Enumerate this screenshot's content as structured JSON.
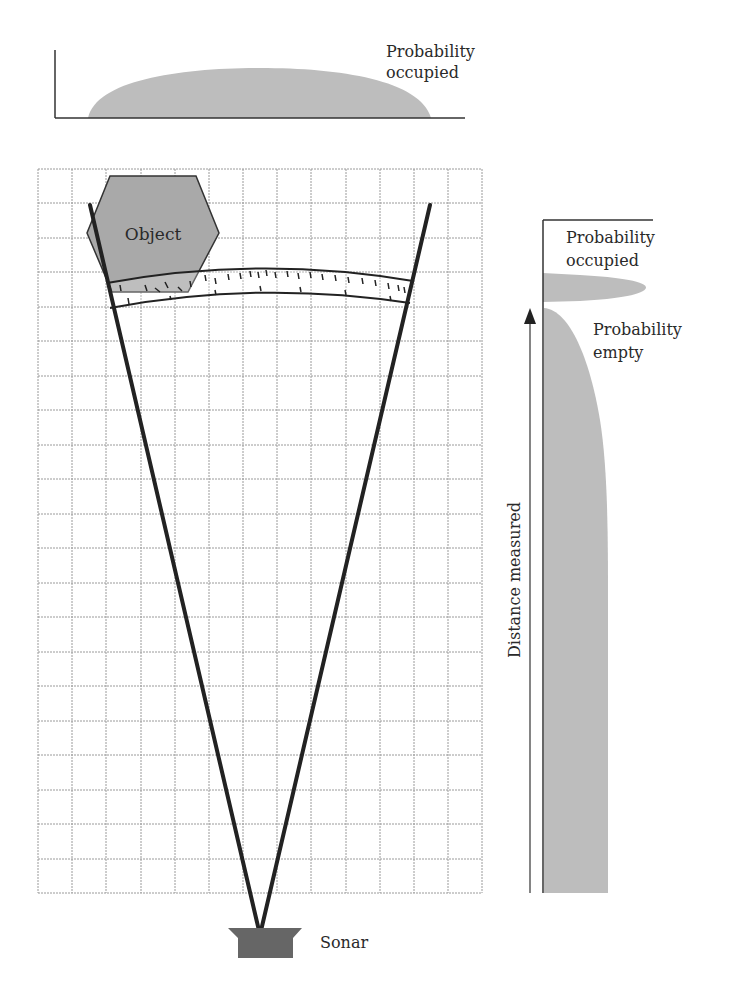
{
  "top_chart": {
    "label_line1": "Probability",
    "label_line2": "occupied"
  },
  "grid": {
    "columns": 13,
    "rows": 21
  },
  "object": {
    "label": "Object"
  },
  "right_chart": {
    "occupied_line1": "Probability",
    "occupied_line2": "occupied",
    "empty_line1": "Probability",
    "empty_line2": "empty",
    "axis_label": "Distance measured"
  },
  "sonar": {
    "label": "Sonar"
  },
  "colors": {
    "fill_gray": "#bdbdbd",
    "object_gray": "#a9a9a9",
    "beam": "#222222",
    "sonar": "#666666",
    "grid_line": "#9a9a9a"
  }
}
